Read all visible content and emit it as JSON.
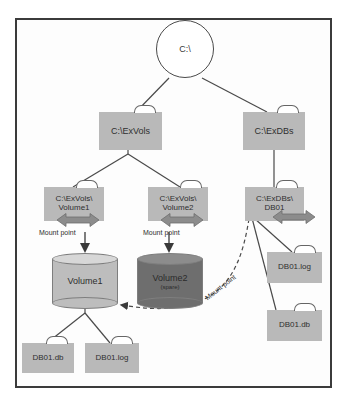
{
  "diagram": {
    "type": "tree-diagram",
    "colors": {
      "frame_border": "#3b3b3b",
      "folder_fill": "#b9b9b9",
      "volume_fill": "#bdbdbd",
      "volume_spare_fill": "#6e6e6e",
      "line": "#4a4a4a",
      "arrow_gray": "#8c8c8c",
      "background": "#ffffff"
    },
    "root": {
      "label": "C:\\",
      "shape": "circle"
    },
    "folders": {
      "exvols": {
        "label": "C:\\ExVols"
      },
      "exdbs": {
        "label": "C:\\ExDBs"
      },
      "exvols_volume1": {
        "label": "C:\\ExVols\\\nVolume1"
      },
      "exvols_volume2": {
        "label": "C:\\ExVols\\\nVolume2"
      },
      "exdbs_db01": {
        "label": "C:\\ExDBs\\\nDB01"
      },
      "left_db01_db": {
        "label": "DB01.db"
      },
      "left_db01_log": {
        "label": "DB01.log"
      },
      "right_db01_log": {
        "label": "DB01.log"
      },
      "right_db01_db": {
        "label": "DB01.db"
      }
    },
    "volumes": {
      "volume1": {
        "name": "Volume1",
        "sub": ""
      },
      "volume2": {
        "name": "Volume2",
        "sub": "(spare)"
      }
    },
    "labels": {
      "mount_point_1": "Mount point",
      "mount_point_2": "Mount point",
      "mount_point_3": "Mount point"
    },
    "icons": {
      "double_arrow_1": "double-arrow-icon",
      "double_arrow_2": "double-arrow-icon",
      "double_arrow_3": "double-arrow-icon",
      "down_arrow_1": "down-arrow-icon",
      "down_arrow_2": "down-arrow-icon",
      "dashed_link_arrow": "dashed-arrow-icon"
    },
    "edges": [
      {
        "from": "C:\\",
        "to": "C:\\ExVols"
      },
      {
        "from": "C:\\",
        "to": "C:\\ExDBs"
      },
      {
        "from": "C:\\ExVols",
        "to": "C:\\ExVols\\Volume1"
      },
      {
        "from": "C:\\ExVols",
        "to": "C:\\ExVols\\Volume2"
      },
      {
        "from": "C:\\ExDBs",
        "to": "C:\\ExDBs\\DB01"
      },
      {
        "from": "C:\\ExVols\\Volume1",
        "to": "Volume1",
        "label": "Mount point"
      },
      {
        "from": "C:\\ExVols\\Volume2",
        "to": "Volume2",
        "label": "Mount point"
      },
      {
        "from": "C:\\ExDBs\\DB01",
        "to": "Volume1",
        "label": "Mount point",
        "style": "dashed"
      },
      {
        "from": "Volume1",
        "to": "DB01.db"
      },
      {
        "from": "Volume1",
        "to": "DB01.log"
      },
      {
        "from": "C:\\ExDBs\\DB01",
        "to": "DB01.log"
      },
      {
        "from": "C:\\ExDBs\\DB01",
        "to": "DB01.db"
      }
    ]
  }
}
